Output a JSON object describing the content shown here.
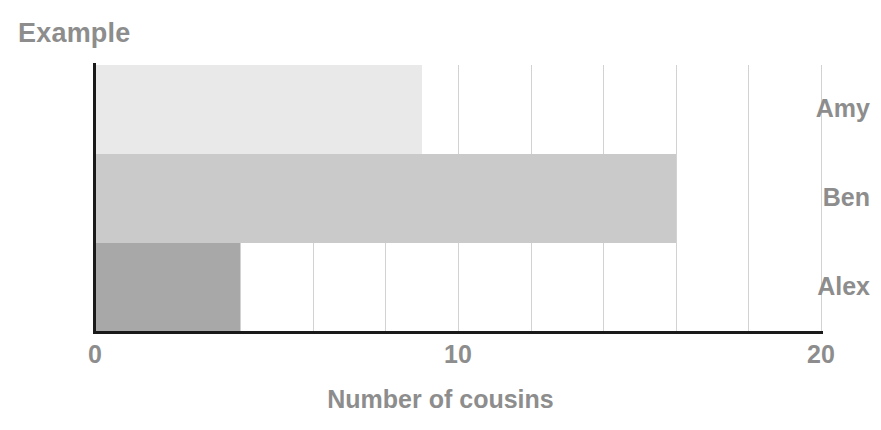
{
  "chart_data": {
    "type": "bar",
    "orientation": "horizontal",
    "title": "Example",
    "xlabel": "Number of cousins",
    "ylabel": "",
    "categories": [
      "Amy",
      "Ben",
      "Alex"
    ],
    "values": [
      9,
      16,
      4
    ],
    "bar_colors": [
      "#e9e9e9",
      "#cacaca",
      "#a8a8a8"
    ],
    "xlim": [
      0,
      20
    ],
    "xticks": [
      0,
      10,
      20
    ],
    "xtick_labels": [
      "0",
      "10",
      "20"
    ],
    "gridline_step": 2,
    "gridline_values": [
      2,
      4,
      6,
      8,
      10,
      12,
      14,
      16,
      18,
      20
    ],
    "grid": true,
    "grid_axis": "x",
    "grid_color": "#d2d2d2",
    "legend": null,
    "legend_position": "none",
    "axis_color": "#1a1a1a",
    "text_color": "#8d8d8d",
    "background": "#ffffff"
  }
}
